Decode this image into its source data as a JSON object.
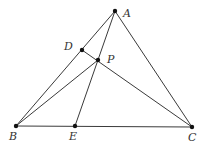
{
  "figure": {
    "points": [
      {
        "id": "A",
        "label": "A",
        "x": 115,
        "y": 11,
        "lx": 123,
        "ly": 17
      },
      {
        "id": "B",
        "label": "B",
        "x": 16,
        "y": 126,
        "lx": 9,
        "ly": 140
      },
      {
        "id": "C",
        "label": "C",
        "x": 192,
        "y": 127,
        "lx": 188,
        "ly": 141
      },
      {
        "id": "D",
        "label": "D",
        "x": 82,
        "y": 50,
        "lx": 64,
        "ly": 50
      },
      {
        "id": "E",
        "label": "E",
        "x": 75,
        "y": 126,
        "lx": 69,
        "ly": 140
      },
      {
        "id": "P",
        "label": "P",
        "x": 98,
        "y": 60,
        "lx": 107,
        "ly": 63
      }
    ],
    "segments": [
      [
        "A",
        "B"
      ],
      [
        "A",
        "C"
      ],
      [
        "B",
        "C"
      ],
      [
        "A",
        "E"
      ],
      [
        "B",
        "P"
      ],
      [
        "D",
        "C"
      ]
    ],
    "line_color": "#3a3a3a",
    "point_color": "#111111"
  }
}
